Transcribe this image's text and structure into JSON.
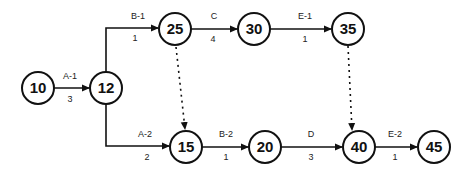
{
  "diagram": {
    "type": "activity-on-arrow network",
    "nodes": [
      {
        "id": "10",
        "label": "10",
        "x": 38,
        "y": 88
      },
      {
        "id": "12",
        "label": "12",
        "x": 106,
        "y": 88
      },
      {
        "id": "25",
        "label": "25",
        "x": 175,
        "y": 30
      },
      {
        "id": "30",
        "label": "30",
        "x": 254,
        "y": 30
      },
      {
        "id": "35",
        "label": "35",
        "x": 348,
        "y": 29
      },
      {
        "id": "15",
        "label": "15",
        "x": 186,
        "y": 147
      },
      {
        "id": "20",
        "label": "20",
        "x": 265,
        "y": 147
      },
      {
        "id": "40",
        "label": "40",
        "x": 359,
        "y": 147
      },
      {
        "id": "45",
        "label": "45",
        "x": 434,
        "y": 147
      }
    ],
    "activities": [
      {
        "from": "10",
        "to": "12",
        "name": "A-1",
        "duration": "3"
      },
      {
        "from": "12",
        "to": "25",
        "name": "B-1",
        "duration": "1"
      },
      {
        "from": "25",
        "to": "30",
        "name": "C",
        "duration": "4"
      },
      {
        "from": "30",
        "to": "35",
        "name": "E-1",
        "duration": "1"
      },
      {
        "from": "12",
        "to": "15",
        "name": "A-2",
        "duration": "2"
      },
      {
        "from": "15",
        "to": "20",
        "name": "B-2",
        "duration": "1"
      },
      {
        "from": "20",
        "to": "40",
        "name": "D",
        "duration": "3"
      },
      {
        "from": "40",
        "to": "45",
        "name": "E-2",
        "duration": "1"
      }
    ],
    "dummies": [
      {
        "from": "25",
        "to": "15"
      },
      {
        "from": "35",
        "to": "40"
      }
    ]
  }
}
